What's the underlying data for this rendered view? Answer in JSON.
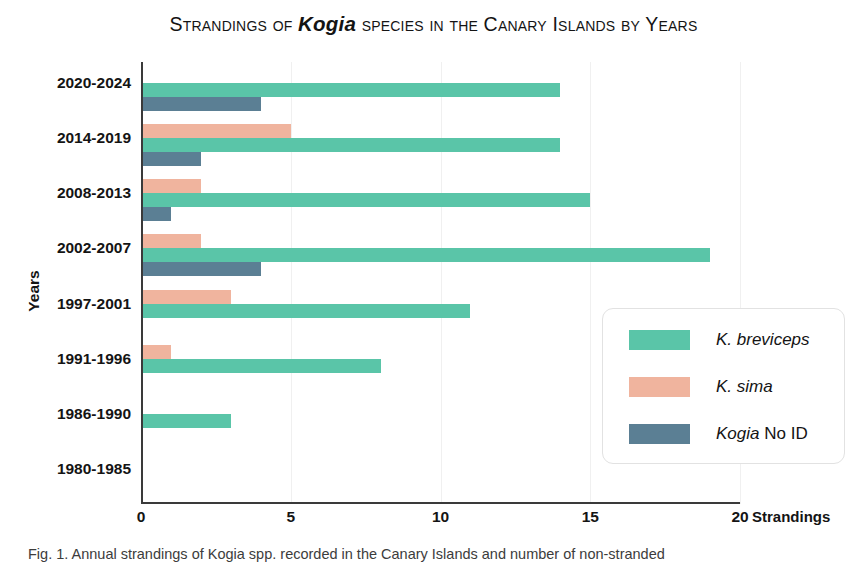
{
  "title": {
    "prefix": "Strandings of ",
    "genus": "Kogia",
    "suffix": " species in the Canary Islands by Years",
    "full": "Strandings of Kogia species in the Canary Islands by Years"
  },
  "axes": {
    "y_title": "Years",
    "x_title": "Strandings",
    "x_ticks": [
      "0",
      "5",
      "10",
      "15",
      "20"
    ]
  },
  "legend": {
    "items": [
      {
        "label_italic": "K. breviceps",
        "label_roman": "",
        "color": "#5ac5a8"
      },
      {
        "label_italic": "K. sima",
        "label_roman": "",
        "color": "#f0b49e"
      },
      {
        "label_italic": "Kogia",
        "label_roman": " No ID",
        "color": "#5b7f94"
      }
    ]
  },
  "caption": {
    "text": "Fig. 1. Annual strandings of Kogia spp. recorded in the Canary Islands and number of non-stranded"
  },
  "chart_data": {
    "type": "bar",
    "orientation": "horizontal",
    "title": "Strandings of Kogia species in the Canary Islands by Years",
    "xlabel": "Strandings",
    "ylabel": "Years",
    "xlim": [
      0,
      20
    ],
    "x_ticks": [
      0,
      5,
      10,
      15,
      20
    ],
    "grid": true,
    "legend_position": "middle-right",
    "categories": [
      "2020-2024",
      "2014-2019",
      "2008-2013",
      "2002-2007",
      "1997-2001",
      "1991-1996",
      "1986-1990",
      "1980-1985"
    ],
    "series": [
      {
        "name": "K. sima",
        "color": "#f0b49e",
        "values": [
          0,
          5,
          2,
          2,
          3,
          1,
          0,
          0
        ]
      },
      {
        "name": "K. breviceps",
        "color": "#5ac5a8",
        "values": [
          14,
          14,
          15,
          19,
          11,
          8,
          3,
          0
        ]
      },
      {
        "name": "Kogia No ID",
        "color": "#5b7f94",
        "values": [
          4,
          2,
          1,
          4,
          0,
          0,
          0,
          0
        ]
      }
    ]
  }
}
